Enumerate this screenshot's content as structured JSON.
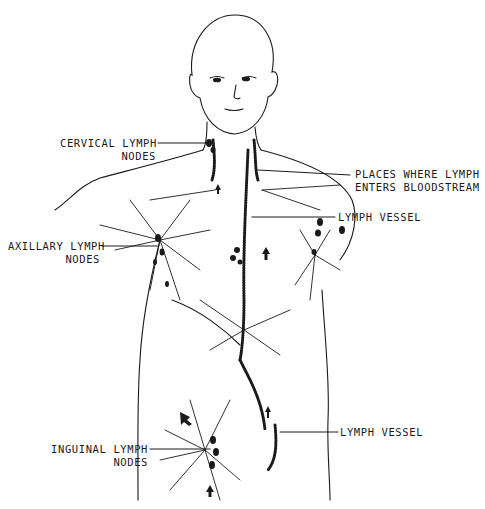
{
  "figure": {
    "ink_color": "#1a1a1a",
    "background": "#ffffff"
  },
  "labels": {
    "cervical": {
      "line1": "CERVICAL LYMPH",
      "line2": "NODES"
    },
    "places": {
      "line1": "PLACES WHERE LYMPH",
      "line2": "ENTERS BLOODSTREAM"
    },
    "vessel_upper": {
      "line1": "LYMPH VESSEL"
    },
    "axillary": {
      "line1": "AXILLARY LYMPH",
      "line2": "NODES"
    },
    "vessel_lower": {
      "line1": "LYMPH VESSEL"
    },
    "inguinal": {
      "line1": "INGUINAL LYMPH",
      "line2": "NODES"
    }
  }
}
